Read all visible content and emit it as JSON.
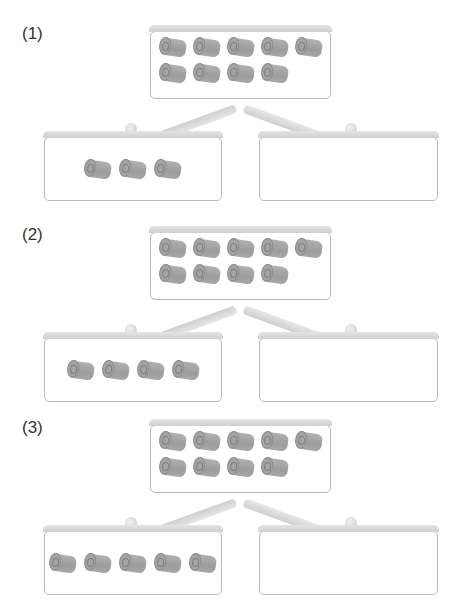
{
  "problems": [
    {
      "label": "(1)",
      "top_box": {
        "roll_count": 9,
        "row_1_count": 5,
        "row_2_count": 4
      },
      "left_box": {
        "roll_count": 3
      },
      "right_box": {
        "roll_count": 0,
        "value": ""
      }
    },
    {
      "label": "(2)",
      "top_box": {
        "roll_count": 9,
        "row_1_count": 5,
        "row_2_count": 4
      },
      "left_box": {
        "roll_count": 4
      },
      "right_box": {
        "roll_count": 0,
        "value": ""
      }
    },
    {
      "label": "(3)",
      "top_box": {
        "roll_count": 9,
        "row_1_count": 5,
        "row_2_count": 4
      },
      "left_box": {
        "roll_count": 5
      },
      "right_box": {
        "roll_count": 0,
        "value": ""
      }
    }
  ],
  "icons": {
    "item": "toilet-paper-roll-icon"
  },
  "colors": {
    "box_border": "#b9b9b9",
    "box_header": "#d8d8d8",
    "roll": "#a4a4a4",
    "arm": "#d6d6d6"
  }
}
